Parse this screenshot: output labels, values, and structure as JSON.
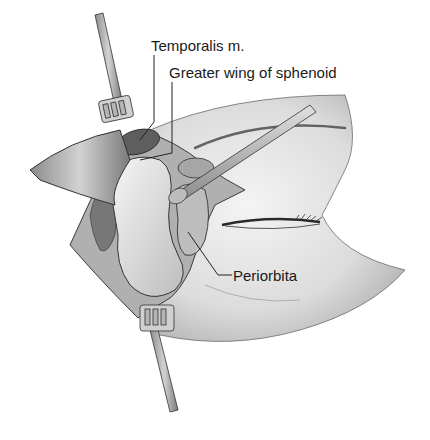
{
  "figure": {
    "labels": [
      {
        "id": "temporalis",
        "text": "Temporalis m."
      },
      {
        "id": "greater-wing",
        "text": "Greater wing of sphenoid"
      },
      {
        "id": "periorbita",
        "text": "Periorbita"
      }
    ]
  },
  "colors": {
    "background": "#ffffff",
    "skin": "#e6e6e6",
    "shadow": "#9a9a9a",
    "outline": "#3a3a3a",
    "label_text": "#1a1a1a"
  }
}
